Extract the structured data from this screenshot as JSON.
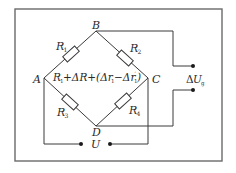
{
  "diagram": {
    "type": "wheatstone-bridge",
    "nodes": {
      "A": "A",
      "B": "B",
      "C": "C",
      "D": "D"
    },
    "resistors": [
      {
        "id": "R1",
        "label": "R",
        "sub": "1",
        "between": [
          "A",
          "B"
        ]
      },
      {
        "id": "R2",
        "label": "R",
        "sub": "2",
        "between": [
          "B",
          "C"
        ]
      },
      {
        "id": "R3",
        "label": "R",
        "sub": "3",
        "between": [
          "A",
          "D"
        ]
      },
      {
        "id": "R4",
        "label": "R",
        "sub": "4",
        "between": [
          "D",
          "C"
        ]
      }
    ],
    "center_expression": {
      "part1": "R",
      "part1_sub": "1",
      "part2": "+ΔR+(Δr",
      "part2_sub": "1",
      "part3": "−Δr",
      "part3_sup": "′",
      "part3_sub": "1",
      "part4": ")"
    },
    "output": {
      "prefix": "Δ",
      "label": "U",
      "sub": "g"
    },
    "supply": {
      "label": "U"
    }
  }
}
